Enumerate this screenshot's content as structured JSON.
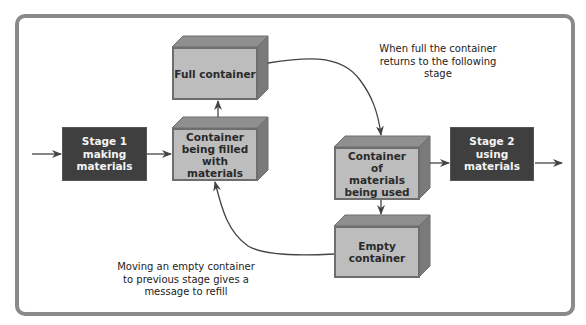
{
  "diagram": {
    "type": "flow",
    "nodes": {
      "stage1": {
        "label": "Stage 1\nmaking\nmaterials",
        "lines": [
          "Stage 1",
          "making",
          "materials"
        ]
      },
      "stage2": {
        "label": "Stage 2\nusing\nmaterials",
        "lines": [
          "Stage 2",
          "using",
          "materials"
        ]
      },
      "full_container": {
        "label": "Full container"
      },
      "filling_container": {
        "label": "Container being filled with materials"
      },
      "in_use_container": {
        "label": "Container of materials being used"
      },
      "empty_container": {
        "label": "Empty container"
      }
    },
    "annotations": {
      "full_return": "When full the container returns to the following stage",
      "empty_refill": "Moving an empty container to previous stage gives a message to refill"
    },
    "edges": [
      {
        "from": "input",
        "to": "stage1"
      },
      {
        "from": "stage1",
        "to": "filling_container"
      },
      {
        "from": "filling_container",
        "to": "full_container"
      },
      {
        "from": "full_container",
        "to": "in_use_container"
      },
      {
        "from": "in_use_container",
        "to": "stage2"
      },
      {
        "from": "stage2",
        "to": "output"
      },
      {
        "from": "in_use_container",
        "to": "empty_container"
      },
      {
        "from": "empty_container",
        "to": "filling_container"
      }
    ],
    "colors": {
      "frame": "#8a8a8a",
      "stage_fill": "#3f3f3f",
      "container_front": "#bdbdbd",
      "container_top": "#8f8f8f",
      "container_side": "#7a7a7a",
      "arrow": "#444444"
    }
  }
}
